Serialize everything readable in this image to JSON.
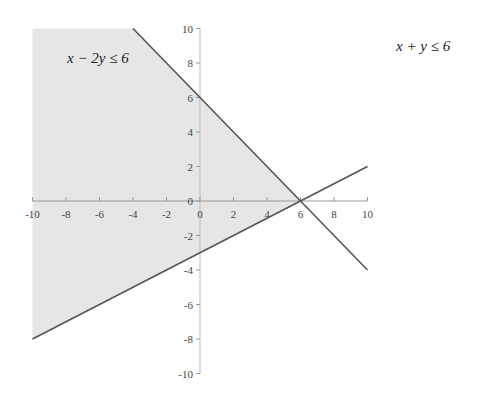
{
  "chart_data": {
    "type": "area",
    "title": "",
    "xlabel": "",
    "ylabel": "",
    "xlim": [
      -10,
      10
    ],
    "ylim": [
      -10,
      10
    ],
    "grid": false,
    "x_ticks": [
      -10,
      -8,
      -6,
      -4,
      -2,
      0,
      2,
      4,
      6,
      8,
      10
    ],
    "y_ticks": [
      10,
      8,
      6,
      4,
      2,
      0,
      -2,
      -4,
      -6,
      -8,
      -10
    ],
    "series": [
      {
        "name": "x + y = 6",
        "type": "line",
        "points": [
          [
            -4,
            10
          ],
          [
            10,
            -4
          ]
        ]
      },
      {
        "name": "x - 2y = 6",
        "type": "line",
        "points": [
          [
            -10,
            -8
          ],
          [
            10,
            2
          ]
        ]
      }
    ],
    "shaded_region": {
      "description": "Feasible region satisfying x + y ≤ 6 and x - 2y ≤ 6",
      "polygon": [
        [
          -10,
          10
        ],
        [
          -4,
          10
        ],
        [
          6,
          0
        ],
        [
          -10,
          -8
        ]
      ],
      "color": "#e6e6e6"
    },
    "annotations": [
      {
        "text": "x − 2y ≤ 6",
        "x": -8,
        "y": 8
      },
      {
        "text": "x + y ≤ 6",
        "position": "top-right outside plot"
      }
    ],
    "colors": {
      "line": "#555555",
      "shade": "#e6e6e6",
      "axis": "#999999"
    }
  },
  "labels": {
    "left_inequality": "x − 2y ≤ 6",
    "right_inequality": "x + y ≤ 6"
  }
}
